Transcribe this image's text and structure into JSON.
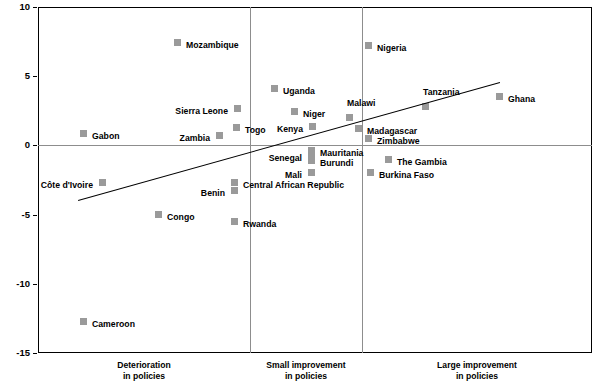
{
  "chart_data": {
    "type": "scatter",
    "title": "",
    "xlabel": "",
    "ylabel": "",
    "ylim": [
      -15,
      10
    ],
    "yticks": [
      10,
      5,
      0,
      -5,
      -10,
      -15
    ],
    "ytick_labels": [
      "10",
      "5",
      "0",
      "-5",
      "-10",
      "-15"
    ],
    "grid": false,
    "legend": false,
    "zero_line": 0,
    "x_categories": [
      {
        "line1": "Deterioration",
        "line2": "in policies"
      },
      {
        "line1": "Small improvement",
        "line2": "in policies"
      },
      {
        "line1": "Large improvement",
        "line2": "in policies"
      }
    ],
    "marker_color": "#9a9a9a",
    "trendline": {
      "color": "#000000",
      "x_start": 78,
      "y_start": 200,
      "x_end": 500,
      "y_end": 82
    },
    "points": [
      {
        "name": "Mozambique",
        "px": 177,
        "py": 42,
        "value": 7.4,
        "side": "lr"
      },
      {
        "name": "Nigeria",
        "px": 368,
        "py": 45,
        "value": 7.2,
        "side": "lr"
      },
      {
        "name": "Uganda",
        "px": 274,
        "py": 88,
        "value": 4.1,
        "side": "lr"
      },
      {
        "name": "Ghana",
        "px": 499,
        "py": 96,
        "value": 3.6,
        "side": "lr"
      },
      {
        "name": "Tanzania",
        "px": 425,
        "py": 106,
        "value": 2.8,
        "side": "lt"
      },
      {
        "name": "Sierra Leone",
        "px": 237,
        "py": 108,
        "value": 2.7,
        "side": "ll"
      },
      {
        "name": "Niger",
        "px": 294,
        "py": 111,
        "value": 2.5,
        "side": "lr"
      },
      {
        "name": "Malawi",
        "px": 349,
        "py": 117,
        "value": 2.0,
        "side": "lt"
      },
      {
        "name": "Kenya",
        "px": 312,
        "py": 126,
        "value": 1.4,
        "side": "ll"
      },
      {
        "name": "Togo",
        "px": 236,
        "py": 127,
        "value": 1.3,
        "side": "lr"
      },
      {
        "name": "Madagascar",
        "px": 358,
        "py": 128,
        "value": 1.2,
        "side": "lr"
      },
      {
        "name": "Gabon",
        "px": 83,
        "py": 133,
        "value": 0.9,
        "side": "lr"
      },
      {
        "name": "Zambia",
        "px": 219,
        "py": 135,
        "value": 0.8,
        "side": "ll"
      },
      {
        "name": "Zimbabwe",
        "px": 368,
        "py": 138,
        "value": 0.5,
        "side": "lr"
      },
      {
        "name": "Mauritania",
        "px": 311,
        "py": 150,
        "value": -0.4,
        "side": "lr"
      },
      {
        "name": "The Gambia",
        "px": 388,
        "py": 159,
        "value": -1.0,
        "side": "lr"
      },
      {
        "name": "Burundi",
        "px": 311,
        "py": 160,
        "value": -1.1,
        "side": "lr"
      },
      {
        "name": "Senegal",
        "px": 311,
        "py": 155,
        "value": -0.7,
        "side": "ll"
      },
      {
        "name": "Mali",
        "px": 311,
        "py": 172,
        "value": -2.0,
        "side": "ll"
      },
      {
        "name": "Burkina Faso",
        "px": 370,
        "py": 172,
        "value": -2.0,
        "side": "lr"
      },
      {
        "name": "Central African Republic",
        "px": 234,
        "py": 182,
        "value": -2.7,
        "side": "lr"
      },
      {
        "name": "Côte d'Ivoire",
        "px": 102,
        "py": 182,
        "value": -2.7,
        "side": "ll"
      },
      {
        "name": "Benin",
        "px": 234,
        "py": 190,
        "value": -3.3,
        "side": "ll"
      },
      {
        "name": "Congo",
        "px": 158,
        "py": 214,
        "value": -5.0,
        "side": "lr"
      },
      {
        "name": "Rwanda",
        "px": 234,
        "py": 221,
        "value": -5.5,
        "side": "lr"
      },
      {
        "name": "Cameroon",
        "px": 83,
        "py": 321,
        "value": -12.3,
        "side": "lr"
      }
    ]
  }
}
